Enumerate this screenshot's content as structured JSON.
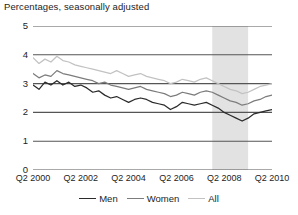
{
  "chart_title": "Percentages, seasonally adjusted",
  "axes": {
    "y_ticks": [
      "5",
      "4",
      "3",
      "2",
      "1",
      "0"
    ],
    "x_ticks": [
      "Q2 2000",
      "Q2 2002",
      "Q2 2004",
      "Q2 2006",
      "Q2 2008",
      "Q2 2010"
    ]
  },
  "legend": {
    "items": [
      {
        "label": "Men",
        "color": "#2b2b2b"
      },
      {
        "label": "Women",
        "color": "#7c7c7c"
      },
      {
        "label": "All",
        "color": "#c2c2c2"
      }
    ]
  },
  "colors": {
    "men": "#2b2b2b",
    "women": "#7c7c7c",
    "all": "#c2c2c2",
    "gridline": "#555555",
    "recession_band": "#e2e2e2",
    "background": "#ffffff"
  },
  "chart_data": {
    "type": "line",
    "title": "Percentages, seasonally adjusted",
    "xlabel": "",
    "ylabel": "Percentages, seasonally adjusted",
    "ylim": [
      0,
      5
    ],
    "yticks": [
      0,
      1,
      2,
      3,
      4,
      5
    ],
    "grid": true,
    "legend_position": "bottom-center",
    "x": [
      "Q2 2000",
      "Q3 2000",
      "Q4 2000",
      "Q1 2001",
      "Q2 2001",
      "Q3 2001",
      "Q4 2001",
      "Q1 2002",
      "Q2 2002",
      "Q3 2002",
      "Q4 2002",
      "Q1 2003",
      "Q2 2003",
      "Q3 2003",
      "Q4 2003",
      "Q1 2004",
      "Q2 2004",
      "Q3 2004",
      "Q4 2004",
      "Q1 2005",
      "Q2 2005",
      "Q3 2005",
      "Q4 2005",
      "Q1 2006",
      "Q2 2006",
      "Q3 2006",
      "Q4 2006",
      "Q1 2007",
      "Q2 2007",
      "Q3 2007",
      "Q4 2007",
      "Q1 2008",
      "Q2 2008",
      "Q3 2008",
      "Q4 2008",
      "Q1 2009",
      "Q2 2009",
      "Q3 2009",
      "Q4 2009",
      "Q1 2010",
      "Q2 2010"
    ],
    "xticks": [
      "Q2 2000",
      "Q2 2002",
      "Q2 2004",
      "Q2 2006",
      "Q2 2008",
      "Q2 2010"
    ],
    "annotations": [
      {
        "type": "vspan",
        "label": "recession",
        "from": "Q4 2007",
        "to": "Q2 2009",
        "color": "#e2e2e2"
      }
    ],
    "series": [
      {
        "name": "Men",
        "color": "#2b2b2b",
        "values": [
          2.95,
          2.8,
          3.05,
          2.95,
          3.1,
          2.95,
          3.05,
          2.9,
          2.95,
          2.85,
          2.7,
          2.75,
          2.6,
          2.5,
          2.55,
          2.45,
          2.35,
          2.45,
          2.5,
          2.45,
          2.35,
          2.3,
          2.25,
          2.1,
          2.2,
          2.35,
          2.3,
          2.25,
          2.3,
          2.35,
          2.25,
          2.15,
          2.0,
          1.9,
          1.8,
          1.7,
          1.8,
          1.95,
          2.0,
          2.05,
          2.1
        ]
      },
      {
        "name": "Women",
        "color": "#7c7c7c",
        "values": [
          3.35,
          3.2,
          3.3,
          3.25,
          3.45,
          3.35,
          3.3,
          3.25,
          3.2,
          3.15,
          3.1,
          3.0,
          3.05,
          2.95,
          2.9,
          2.85,
          2.8,
          2.85,
          2.9,
          2.8,
          2.75,
          2.7,
          2.65,
          2.55,
          2.6,
          2.7,
          2.65,
          2.6,
          2.7,
          2.75,
          2.7,
          2.6,
          2.5,
          2.4,
          2.35,
          2.25,
          2.3,
          2.4,
          2.45,
          2.55,
          2.6
        ]
      },
      {
        "name": "All",
        "color": "#c2c2c2",
        "values": [
          3.9,
          3.7,
          3.85,
          3.75,
          3.95,
          3.8,
          3.75,
          3.65,
          3.6,
          3.55,
          3.5,
          3.45,
          3.4,
          3.35,
          3.45,
          3.35,
          3.25,
          3.3,
          3.35,
          3.25,
          3.2,
          3.15,
          3.1,
          3.0,
          3.05,
          3.15,
          3.1,
          3.05,
          3.15,
          3.2,
          3.1,
          3.0,
          2.9,
          2.8,
          2.75,
          2.65,
          2.7,
          2.8,
          2.9,
          2.95,
          3.0
        ]
      }
    ]
  }
}
